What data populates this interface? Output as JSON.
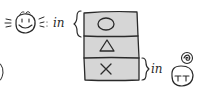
{
  "diagram": {
    "style": "hand-drawn sketch",
    "happy_face": {
      "expression": "smiling",
      "label": "in",
      "points_to": "top cell"
    },
    "stack": {
      "fill_color": "#d6d6d6",
      "cells": [
        {
          "symbol_name": "circle",
          "glyph": "○"
        },
        {
          "symbol_name": "triangle",
          "glyph": "△"
        },
        {
          "symbol_name": "cross",
          "glyph": "×"
        }
      ]
    },
    "sad_face": {
      "expression": "crying",
      "label": "in",
      "points_to": "bottom cell",
      "thought_bubble": "scribble"
    }
  }
}
